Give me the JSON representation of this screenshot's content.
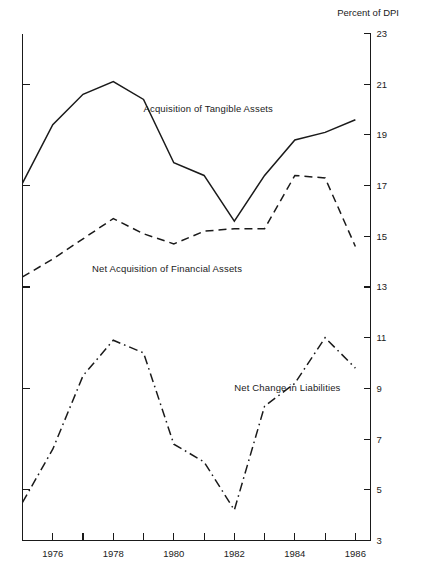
{
  "chart_data": {
    "type": "line",
    "title": "",
    "axis_title": "Percent of DPI",
    "xlabel": "",
    "ylabel": "Percent of DPI",
    "xlim": [
      1975,
      1986.5
    ],
    "ylim": [
      3,
      23
    ],
    "grid": false,
    "legend": "inline-labels",
    "y_ticks": [
      3,
      5,
      7,
      9,
      11,
      13,
      15,
      17,
      19,
      21,
      23
    ],
    "y_tick_labels": [
      "3",
      "5",
      "7",
      "9",
      "11",
      "13",
      "15",
      "17",
      "19",
      "21",
      "23"
    ],
    "y_tick_side": "right",
    "x_ticks": [
      1975,
      1976,
      1977,
      1978,
      1979,
      1980,
      1981,
      1982,
      1983,
      1984,
      1985,
      1986
    ],
    "x_tick_labels_shown": [
      "1976",
      "1978",
      "1980",
      "1982",
      "1984",
      "1986"
    ],
    "x_labeled_years": [
      1976,
      1978,
      1980,
      1982,
      1984,
      1986
    ],
    "x": [
      1975,
      1976,
      1977,
      1978,
      1979,
      1980,
      1981,
      1982,
      1983,
      1984,
      1985,
      1986
    ],
    "series": [
      {
        "name": "Acquisition of Tangible Assets",
        "style": "solid",
        "label_x": 1979.0,
        "label_y": 19.9,
        "values": [
          17.1,
          19.4,
          20.6,
          21.1,
          20.4,
          17.9,
          17.4,
          15.6,
          17.4,
          18.8,
          19.1,
          19.6
        ]
      },
      {
        "name": "Net Acquisition of Financial Assets",
        "style": "dashed",
        "label_x": 1977.3,
        "label_y": 13.6,
        "values": [
          13.4,
          14.1,
          14.9,
          15.7,
          15.1,
          14.7,
          15.2,
          15.3,
          15.3,
          17.4,
          17.3,
          14.6
        ]
      },
      {
        "name": "Net Change in Liabilities",
        "style": "dashdot",
        "label_x": 1982.0,
        "label_y": 8.9,
        "values": [
          4.5,
          6.6,
          9.5,
          10.9,
          10.4,
          6.8,
          6.1,
          4.2,
          8.3,
          9.2,
          11.0,
          9.8
        ]
      }
    ]
  }
}
